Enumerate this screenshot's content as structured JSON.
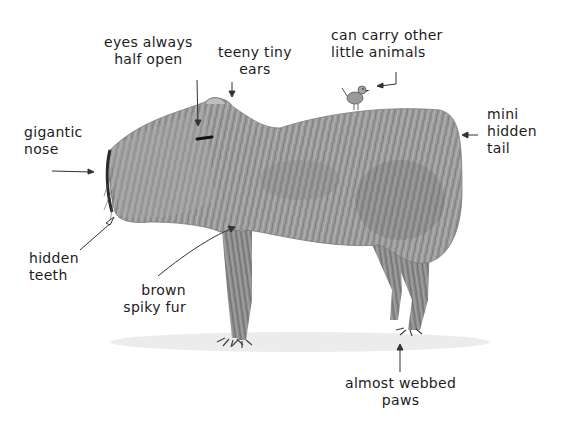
{
  "diagram": {
    "style": "pencil sketch",
    "colors": {
      "background": "#ffffff",
      "fur_light": "#b8b8b8",
      "fur_dark": "#6a6a6a",
      "ink": "#1c1c1c"
    },
    "labels": [
      {
        "id": "eyes",
        "line1": "eyes always",
        "line2": "half open"
      },
      {
        "id": "ears",
        "line1": "teeny tiny",
        "line2": "ears"
      },
      {
        "id": "animals",
        "line1": "can carry other",
        "line2": "little animals"
      },
      {
        "id": "nose",
        "line1": "gigantic",
        "line2": "nose"
      },
      {
        "id": "tail",
        "line1": "mini",
        "line2": "hidden",
        "line3": "tail"
      },
      {
        "id": "teeth",
        "line1": "hidden",
        "line2": "teeth"
      },
      {
        "id": "fur",
        "line1": "brown",
        "line2": "spiky fur"
      },
      {
        "id": "paws",
        "line1": "almost webbed",
        "line2": "paws"
      }
    ]
  }
}
